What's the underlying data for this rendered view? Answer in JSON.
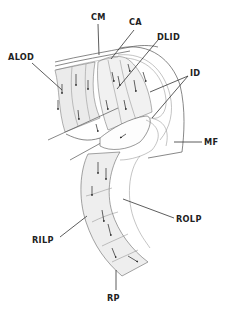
{
  "figure": {
    "type": "anatomical line drawing",
    "labels": [
      {
        "id": "CM",
        "text": "CM",
        "x": 90,
        "y": 19
      },
      {
        "id": "CA",
        "text": "CA",
        "x": 130,
        "y": 24
      },
      {
        "id": "DLID",
        "text": "DLID",
        "x": 157,
        "y": 40
      },
      {
        "id": "ALOD",
        "text": "ALOD",
        "x": 8,
        "y": 59
      },
      {
        "id": "ID",
        "text": "ID",
        "x": 189,
        "y": 75
      },
      {
        "id": "MF",
        "text": "MF",
        "x": 205,
        "y": 145
      },
      {
        "id": "ROLP",
        "text": "ROLP",
        "x": 176,
        "y": 220
      },
      {
        "id": "RILP",
        "text": "RILP",
        "x": 32,
        "y": 241
      },
      {
        "id": "RP",
        "text": "RP",
        "x": 106,
        "y": 300
      }
    ],
    "colors": {
      "ink": "#222222",
      "outline": "#555555",
      "hatch": "#aaaaaa",
      "background": "#ffffff"
    }
  }
}
